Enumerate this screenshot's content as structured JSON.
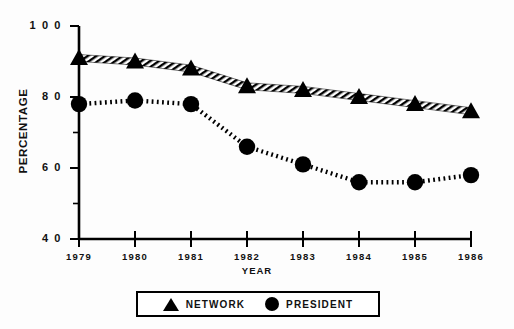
{
  "chart_data": {
    "type": "line",
    "title": "",
    "xlabel": "YEAR",
    "ylabel": "PERCENTAGE",
    "categories": [
      "1979",
      "1980",
      "1981",
      "1982",
      "1983",
      "1984",
      "1985",
      "1986"
    ],
    "x": [
      1979,
      1980,
      1981,
      1982,
      1983,
      1984,
      1985,
      1986
    ],
    "xlim": [
      1979,
      1986
    ],
    "ylim": [
      40,
      100
    ],
    "yticks": [
      40,
      60,
      80,
      100
    ],
    "ytick_labels": [
      "4 0",
      "6 0",
      "8 0",
      "1 0 0"
    ],
    "minor_yticks": [
      50,
      70,
      90
    ],
    "grid": false,
    "legend_position": "bottom",
    "series": [
      {
        "name": "NETWORK",
        "marker": "triangle",
        "line_style": "hatched-band",
        "color": "#000000",
        "values": [
          91,
          90,
          88,
          83,
          82,
          80,
          78,
          76
        ]
      },
      {
        "name": "PRESIDENT",
        "marker": "circle",
        "line_style": "dotted",
        "color": "#000000",
        "values": [
          78,
          79,
          78,
          66,
          61,
          56,
          56,
          58
        ]
      }
    ]
  },
  "axes": {
    "y_title": "PERCENTAGE",
    "x_title": "YEAR"
  },
  "legend": {
    "items": [
      {
        "label": "NETWORK",
        "marker": "triangle-icon"
      },
      {
        "label": "PRESIDENT",
        "marker": "circle-icon"
      }
    ]
  }
}
